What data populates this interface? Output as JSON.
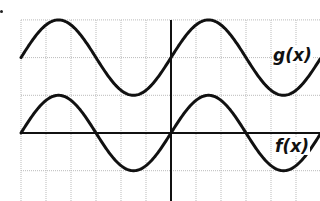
{
  "chart_data": {
    "type": "line",
    "title": "",
    "xlabel": "",
    "ylabel": "",
    "grid": true,
    "x_range_units": [
      -6,
      5.6
    ],
    "y_range_units": [
      -1.8,
      3.1
    ],
    "grid_cell_units": {
      "x": 1,
      "y": 1
    },
    "series": [
      {
        "name": "f(x)",
        "description": "sine wave through origin, amplitude 1, period 6 grid units",
        "expression": "sin(pi*x/3)",
        "key_points": [
          {
            "x": -6,
            "y": 0
          },
          {
            "x": -4.5,
            "y": 1
          },
          {
            "x": -3,
            "y": 0
          },
          {
            "x": -1.5,
            "y": -1
          },
          {
            "x": 0,
            "y": 0
          },
          {
            "x": 1.5,
            "y": 1
          },
          {
            "x": 3,
            "y": 0
          },
          {
            "x": 4.5,
            "y": -1
          }
        ]
      },
      {
        "name": "g(x)",
        "description": "f(x) shifted up 2 units",
        "expression": "sin(pi*x/3) + 2",
        "key_points": [
          {
            "x": -6,
            "y": 2
          },
          {
            "x": -4.5,
            "y": 3
          },
          {
            "x": -3,
            "y": 2
          },
          {
            "x": -1.5,
            "y": 1
          },
          {
            "x": 0,
            "y": 2
          },
          {
            "x": 1.5,
            "y": 3
          },
          {
            "x": 3,
            "y": 2
          },
          {
            "x": 4.5,
            "y": 1
          }
        ]
      }
    ],
    "annotations": [
      "g(x)",
      "f(x)"
    ]
  },
  "labels": {
    "g": "g(x)",
    "f": "f(x)"
  },
  "style": {
    "curve_color": "#111111",
    "axis_color": "#111111",
    "grid_color": "#bbbbbb"
  }
}
